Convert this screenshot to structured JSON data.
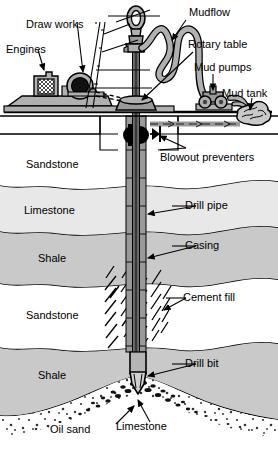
{
  "diagram": {
    "labels": {
      "draw_works": "Draw works",
      "engines": "Engines",
      "mudflow": "Mudflow",
      "rotary_table": "Rotary table",
      "mud_pumps": "Mud pumps",
      "mud_tank": "Mud tank",
      "blowout_preventers": "Blowout preventers",
      "drill_pipe": "Drill pipe",
      "casing": "Casing",
      "cement_fill": "Cement fill",
      "drill_bit": "Drill bit",
      "oil_sand": "Oil sand",
      "limestone_bottom": "Limestone"
    },
    "strata": [
      {
        "name": "Sandstone",
        "fill": "#ffffff",
        "top": 118,
        "bottom": 190
      },
      {
        "name": "Limestone",
        "fill": "#e8e8e8",
        "top": 190,
        "bottom": 236
      },
      {
        "name": "Shale",
        "fill": "#c9c9c9",
        "top": 236,
        "bottom": 288
      },
      {
        "name": "Sandstone",
        "fill": "#ffffff",
        "top": 288,
        "bottom": 350
      },
      {
        "name": "Shale",
        "fill": "#c9c9c9",
        "top": 350,
        "bottom": 412
      },
      {
        "name": "Oil sand",
        "fill": "#ffffff",
        "top": 412,
        "bottom": 450
      }
    ],
    "colors": {
      "ink": "#000000",
      "equipment_gray": "#b0b0b0",
      "equipment_dark": "#6e6e6e",
      "pipe_gray": "#9a9a9a",
      "limestone": "#e8e8e8",
      "shale": "#c9c9c9",
      "sandstone": "#ffffff",
      "background": "#ffffff"
    },
    "icons": {
      "crown_block": "crown-block-icon",
      "engine_block": "engine-icon",
      "drawworks_drum": "drawworks-drum-icon",
      "mud_pump": "mud-pump-icon",
      "bop_ram": "blowout-preventer-ram-icon",
      "drill_bit": "drill-bit-icon"
    }
  }
}
